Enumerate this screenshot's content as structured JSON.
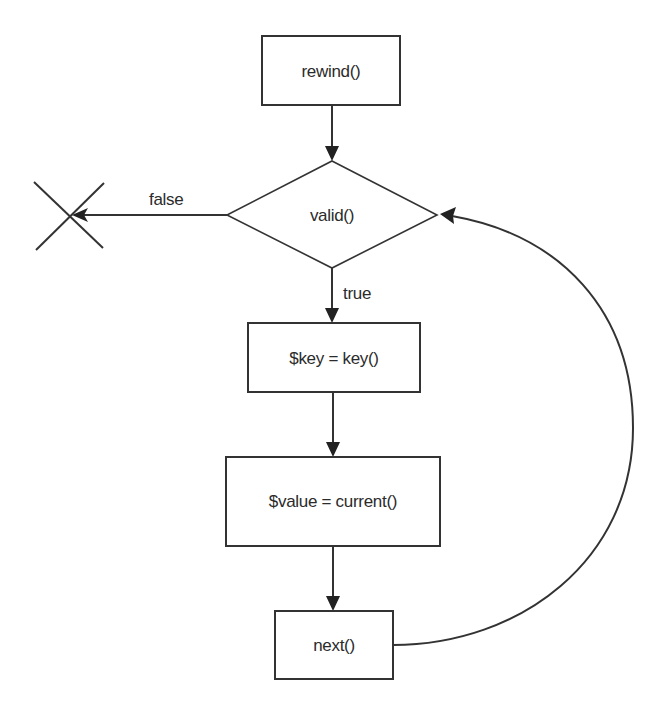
{
  "diagram": {
    "type": "flowchart",
    "title": "",
    "colors": {
      "stroke": "#333333",
      "text": "#2b2b2b",
      "background": "#ffffff"
    },
    "nodes": {
      "rewind": {
        "label": "rewind()",
        "shape": "rectangle"
      },
      "valid": {
        "label": "valid()",
        "shape": "diamond"
      },
      "key": {
        "label": "$key = key()",
        "shape": "rectangle"
      },
      "current": {
        "label": "$value = current()",
        "shape": "rectangle"
      },
      "next": {
        "label": "next()",
        "shape": "rectangle"
      },
      "end": {
        "label": "",
        "shape": "x-terminator"
      }
    },
    "edges": [
      {
        "from": "rewind",
        "to": "valid",
        "label": ""
      },
      {
        "from": "valid",
        "to": "end",
        "label": "false"
      },
      {
        "from": "valid",
        "to": "key",
        "label": "true"
      },
      {
        "from": "key",
        "to": "current",
        "label": ""
      },
      {
        "from": "current",
        "to": "next",
        "label": ""
      },
      {
        "from": "next",
        "to": "valid",
        "label": "",
        "style": "curved-loop"
      }
    ],
    "edge_labels": {
      "false": "false",
      "true": "true"
    }
  }
}
